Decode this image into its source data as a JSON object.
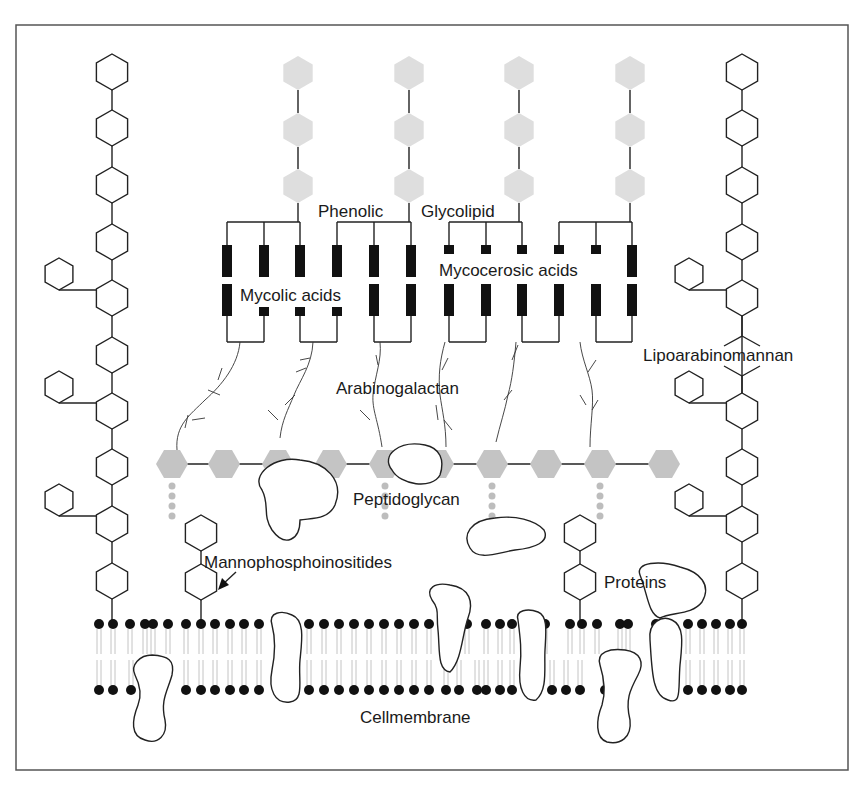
{
  "figure": {
    "labels": {
      "phenolic": "Phenolic",
      "glycolipid": "Glycolipid",
      "mycolic_acids": "Mycolic acids",
      "mycocerosic_acids": "Mycocerosic acids",
      "arabinogalactan": "Arabinogalactan",
      "lipoarabinomannan": "Lipoarabinomannan",
      "peptidoglycan": "Peptidoglycan",
      "mannophosphoinositides": "Mannophosphoinositides",
      "proteins": "Proteins",
      "cell_membrane": "Cellmembrane"
    },
    "colors": {
      "line": "#222222",
      "block": "#111111",
      "peptidoglycan_fill": "#c4c4c4",
      "glycolipid_fill": "#dedede",
      "lipid_tail": "#bdbdbd",
      "frame": "#555555",
      "background": "#ffffff"
    },
    "components": [
      {
        "name": "Phenolic glycolipid",
        "count_chains": 4,
        "sugars_per_chain": 3
      },
      {
        "name": "Mycolic acids",
        "groups": 3
      },
      {
        "name": "Mycocerosic acids",
        "groups": 3
      },
      {
        "name": "Arabinogalactan",
        "branches": 6
      },
      {
        "name": "Peptidoglycan",
        "units": 10,
        "peptide_crosslinks": 5
      },
      {
        "name": "Lipoarabinomannan",
        "chains": 2
      },
      {
        "name": "Mannophosphoinositides",
        "chains": 2
      },
      {
        "name": "Proteins",
        "count": 8
      },
      {
        "name": "Cellmembrane",
        "type": "lipid bilayer"
      }
    ]
  }
}
